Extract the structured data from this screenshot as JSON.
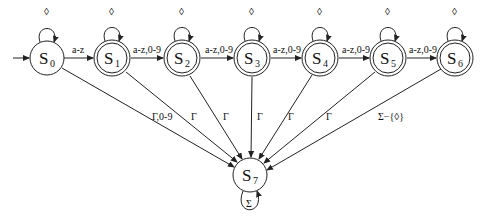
{
  "diagram": {
    "type": "finite-state-automaton",
    "states": [
      {
        "id": "S0",
        "label": "S",
        "sub": "0",
        "x": 47,
        "y": 58,
        "accepting": false,
        "initial": true
      },
      {
        "id": "S1",
        "label": "S",
        "sub": "1",
        "x": 112,
        "y": 58,
        "accepting": true
      },
      {
        "id": "S2",
        "label": "S",
        "sub": "2",
        "x": 182,
        "y": 58,
        "accepting": true
      },
      {
        "id": "S3",
        "label": "S",
        "sub": "3",
        "x": 252,
        "y": 58,
        "accepting": true
      },
      {
        "id": "S4",
        "label": "S",
        "sub": "4",
        "x": 320,
        "y": 58,
        "accepting": true
      },
      {
        "id": "S5",
        "label": "S",
        "sub": "5",
        "x": 388,
        "y": 58,
        "accepting": true
      },
      {
        "id": "S6",
        "label": "S",
        "sub": "6",
        "x": 455,
        "y": 58,
        "accepting": true
      },
      {
        "id": "S7",
        "label": "S",
        "sub": "7",
        "x": 250,
        "y": 175,
        "accepting": false
      }
    ],
    "self_loops": [
      {
        "state": "S0",
        "label": "◊"
      },
      {
        "state": "S1",
        "label": "◊"
      },
      {
        "state": "S2",
        "label": "◊"
      },
      {
        "state": "S3",
        "label": "◊"
      },
      {
        "state": "S4",
        "label": "◊"
      },
      {
        "state": "S5",
        "label": "◊"
      },
      {
        "state": "S6",
        "label": "◊"
      },
      {
        "state": "S7",
        "label": "Σ"
      }
    ],
    "transitions": [
      {
        "from": "S0",
        "to": "S1",
        "label": "a-z"
      },
      {
        "from": "S1",
        "to": "S2",
        "label": "a-z,0-9"
      },
      {
        "from": "S2",
        "to": "S3",
        "label": "a-z,0-9"
      },
      {
        "from": "S3",
        "to": "S4",
        "label": "a-z,0-9"
      },
      {
        "from": "S4",
        "to": "S5",
        "label": "a-z,0-9"
      },
      {
        "from": "S5",
        "to": "S6",
        "label": "a-z,0-9"
      },
      {
        "from": "S0",
        "to": "S7",
        "label": "Γ,0-9"
      },
      {
        "from": "S1",
        "to": "S7",
        "label": "Γ"
      },
      {
        "from": "S2",
        "to": "S7",
        "label": "Γ"
      },
      {
        "from": "S3",
        "to": "S7",
        "label": "Γ"
      },
      {
        "from": "S4",
        "to": "S7",
        "label": "Γ"
      },
      {
        "from": "S5",
        "to": "S7",
        "label": "Γ"
      },
      {
        "from": "S6",
        "to": "S7",
        "label": "Σ−{◊}"
      }
    ]
  }
}
